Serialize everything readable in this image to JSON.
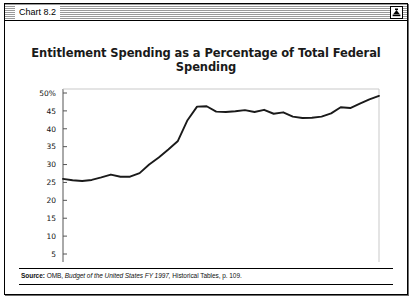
{
  "window": {
    "title": "Chart 8.2",
    "zoom_box_icon": "zoom-window-icon"
  },
  "chart_title": "Entitlement Spending as a Percentage of Total Federal Spending",
  "source": {
    "label": "Source:",
    "publisher": "OMB,",
    "work_italic": "Budget of the United States FY 1997,",
    "tail": "Historical Tables, p. 109."
  },
  "chart_data": {
    "type": "line",
    "title": "Entitlement Spending as a Percentage of Total Federal Spending",
    "xlabel": "",
    "ylabel": "",
    "xlim": [
      1962,
      1995
    ],
    "ylim": [
      0,
      50
    ],
    "grid": false,
    "legend": "none",
    "y_ticks": [
      50,
      45,
      40,
      35,
      30,
      25,
      20,
      15,
      10,
      5
    ],
    "y_tick_labels": [
      "50%",
      "45",
      "40",
      "35",
      "30",
      "25",
      "20",
      "15",
      "10",
      "5"
    ],
    "x_ticks": [
      1965,
      1970,
      1975,
      1980,
      1985,
      1990,
      1995
    ],
    "x_tick_labels": [
      "1965",
      "1970",
      "1975",
      "1980",
      "1985",
      "1990",
      "1995"
    ],
    "x_minor_tick_step": 1,
    "line_color": "#1a1a1a",
    "series": [
      {
        "name": "Entitlement spending share of total federal spending",
        "x": [
          1962,
          1963,
          1964,
          1965,
          1966,
          1967,
          1968,
          1969,
          1970,
          1971,
          1972,
          1973,
          1974,
          1975,
          1976,
          1977,
          1978,
          1979,
          1980,
          1981,
          1982,
          1983,
          1984,
          1985,
          1986,
          1987,
          1988,
          1989,
          1990,
          1991,
          1992,
          1993,
          1994,
          1995
        ],
        "values": [
          26.0,
          25.6,
          25.4,
          25.7,
          26.4,
          27.2,
          26.6,
          26.6,
          27.6,
          30.0,
          32.0,
          34.2,
          36.6,
          42.4,
          46.2,
          46.3,
          44.8,
          44.7,
          44.9,
          45.2,
          44.7,
          45.3,
          44.2,
          44.6,
          43.4,
          43.0,
          43.1,
          43.4,
          44.3,
          46.0,
          45.8,
          47.0,
          48.2,
          49.2
        ]
      }
    ]
  }
}
